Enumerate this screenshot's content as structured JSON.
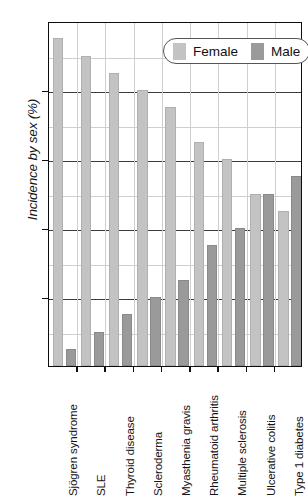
{
  "chart_data": {
    "type": "bar",
    "title": "",
    "xlabel": "",
    "ylabel": "Incidence by sex (%)",
    "ylim": [
      0,
      100
    ],
    "ytick_values": [
      0,
      20,
      40,
      60,
      80,
      100
    ],
    "ytick_labels": [
      "0",
      "20",
      "40",
      "60",
      "80",
      "100"
    ],
    "yminor_values": [
      10,
      30,
      50,
      70,
      90
    ],
    "grid": "horizontal-major-and-minor",
    "legend_position": "top-right-inside",
    "categories": [
      "Sjögren syndrome",
      "SLE",
      "Thyroid disease",
      "Scleroderma",
      "Myasthenia gravis",
      "Rheumatoid arthritis",
      "Multiple sclerosis",
      "Ulcerative colitis",
      "Type 1 diabetes"
    ],
    "series": [
      {
        "name": "Female",
        "color": "#c3c3c3",
        "values": [
          95,
          90,
          85,
          80,
          75,
          65,
          60,
          50,
          45
        ]
      },
      {
        "name": "Male",
        "color": "#9a9a9a",
        "values": [
          5,
          10,
          15,
          20,
          25,
          35,
          40,
          50,
          55
        ]
      }
    ]
  },
  "legend": {
    "female_label": "Female",
    "male_label": "Male"
  }
}
